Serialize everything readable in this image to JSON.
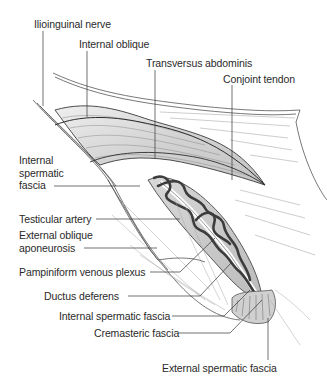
{
  "figure": {
    "type": "anatomical-illustration"
  },
  "labels": {
    "ilioinguinal_nerve": "Ilioinguinal nerve",
    "internal_oblique": "Internal oblique",
    "transversus_abdominis": "Transversus abdominis",
    "conjoint_tendon": "Conjoint tendon",
    "internal_spermatic_fascia_upper": [
      "Internal",
      "spermatic",
      "fascia"
    ],
    "testicular_artery": "Testicular artery",
    "external_oblique_aponeurosis": [
      "External oblique",
      "aponeurosis"
    ],
    "pampiniform_venous_plexus": "Pampiniform venous plexus",
    "ductus_deferens": "Ductus deferens",
    "internal_spermatic_fascia_lower": "Internal spermatic fascia",
    "cremasteric_fascia": "Cremasteric fascia",
    "external_spermatic_fascia": "External spermatic fascia"
  },
  "colors": {
    "line": "#3a3a3a",
    "muscle_fill": "#d6d6d6",
    "muscle_dark": "#bdbdbd",
    "vessel": "#3c3c3c",
    "sheath": "#c8c8c8",
    "text": "#2a2a2a"
  }
}
